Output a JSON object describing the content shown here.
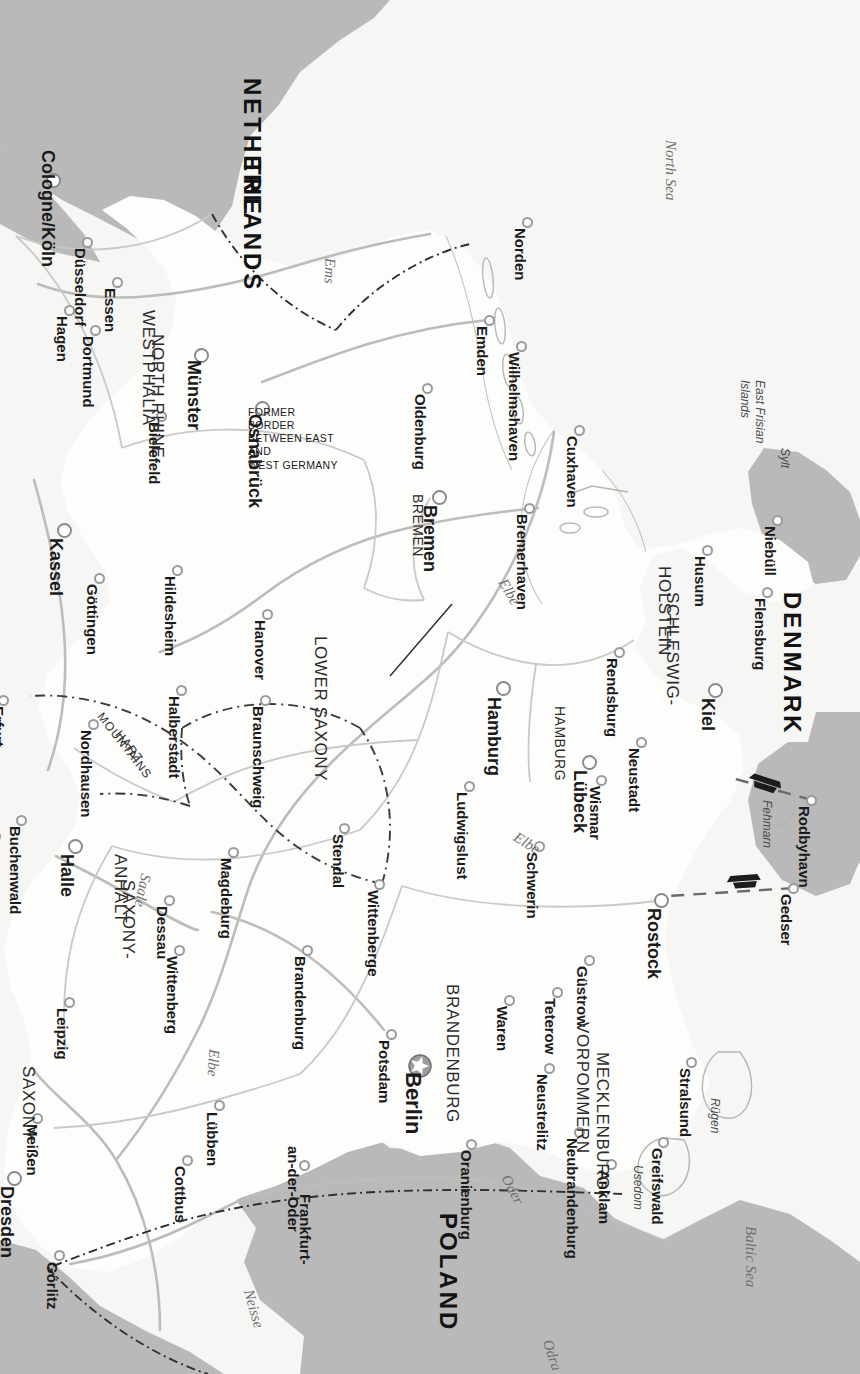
{
  "page": {
    "corner_marker": "16",
    "title": "Germany"
  },
  "annotations": {
    "former_border": "FORMER BORDER BETWEEN EAST AND WEST GERMANY",
    "former_border_lines": [
      "FORMER BORDER",
      "BETWEEN EAST AND",
      "WEST GERMANY"
    ]
  },
  "colors": {
    "neighbour_fill": "#b9b9b9",
    "sea_fill": "#f4f4f2",
    "germany_fill": "#fdfdfc",
    "border_line": "#8f8f8f",
    "river_line": "#b4b4b4",
    "dashed_border": "#3a3a3a",
    "paper": "#f2f2f0"
  },
  "countries": [
    {
      "name": "POLAND",
      "x": 1213,
      "y": 412,
      "rot": 0
    },
    {
      "name": "DENMARK",
      "x": 592,
      "y": 68,
      "rot": 0
    },
    {
      "name": "THE",
      "x": 160,
      "y": 608,
      "rot": 0
    },
    {
      "name": "NETHERLANDS",
      "x": 78,
      "y": 608,
      "rot": 0
    }
  ],
  "seas": [
    {
      "name": "Baltic Sea",
      "x": 1226,
      "y": 110,
      "rot": 0
    },
    {
      "name": "North Sea",
      "x": 140,
      "y": 190,
      "rot": 0
    }
  ],
  "rivers": [
    {
      "name": "Odra",
      "x": 1340,
      "y": 313,
      "rot": -18
    },
    {
      "name": "Oder",
      "x": 1176,
      "y": 355,
      "rot": -28
    },
    {
      "name": "Neisse",
      "x": 1290,
      "y": 612,
      "rot": -16
    },
    {
      "name": "Elbe",
      "x": 1049,
      "y": 646,
      "rot": 4
    },
    {
      "name": "Elbe",
      "x": 836,
      "y": 345,
      "rot": -58
    },
    {
      "name": "Elbe",
      "x": 580,
      "y": 358,
      "rot": -30
    },
    {
      "name": "Saale",
      "x": 874,
      "y": 714,
      "rot": 12
    },
    {
      "name": "Ems",
      "x": 258,
      "y": 530,
      "rot": 2
    }
  ],
  "islands": [
    {
      "name": "Rügen",
      "x": 1098,
      "y": 145
    },
    {
      "name": "Usedom",
      "x": 1165,
      "y": 222
    },
    {
      "name": "Fehmarn",
      "x": 800,
      "y": 93
    },
    {
      "name": "Sylt",
      "x": 448,
      "y": 75
    },
    {
      "name": "East Frisian\nIslands",
      "x": 380,
      "y": 100
    }
  ],
  "states": [
    {
      "name": "MECKLENBURG-",
      "x": 1052,
      "y": 258,
      "cls": "state"
    },
    {
      "name": "VORPOMMERN",
      "x": 1022,
      "y": 278,
      "cls": "state"
    },
    {
      "name": "BRANDENBURG",
      "x": 984,
      "y": 408,
      "cls": "state"
    },
    {
      "name": "SAXONY",
      "x": 1066,
      "y": 832,
      "cls": "state"
    },
    {
      "name": "SAXONY-",
      "x": 880,
      "y": 732,
      "cls": "state"
    },
    {
      "name": "ANHALT",
      "x": 854,
      "y": 740,
      "cls": "state"
    },
    {
      "name": "LOWER SAXONY",
      "x": 636,
      "y": 540,
      "cls": "state"
    },
    {
      "name": "NORTH RHINE-",
      "x": 334,
      "y": 703,
      "cls": "state"
    },
    {
      "name": "WESTPHALIA",
      "x": 310,
      "y": 712,
      "cls": "state"
    },
    {
      "name": "SCHLESWIG-",
      "x": 592,
      "y": 188,
      "cls": "state"
    },
    {
      "name": "HOLSTEIN",
      "x": 566,
      "y": 196,
      "cls": "state"
    },
    {
      "name": "HAMBURG",
      "x": 706,
      "y": 300,
      "cls": "state-sm"
    },
    {
      "name": "BREMEN",
      "x": 494,
      "y": 442,
      "cls": "state-sm"
    }
  ],
  "mountains": [
    {
      "name": "HARZ",
      "x": 732,
      "y": 742
    },
    {
      "name": "MOUNTAINS",
      "x": 714,
      "y": 760
    }
  ],
  "cities": [
    {
      "name": "Berlin",
      "x": 1066,
      "y": 440,
      "dx": 1072,
      "dy": 447,
      "size": "lg",
      "capital": true
    },
    {
      "name": "Hamburg",
      "x": 688,
      "y": 356,
      "dx": 697,
      "dy": 366,
      "size": "md"
    },
    {
      "name": "Bremen",
      "x": 497,
      "y": 420,
      "dx": 505,
      "dy": 430,
      "size": "md"
    },
    {
      "name": "Lübeck",
      "x": 762,
      "y": 270,
      "dx": 770,
      "dy": 280,
      "size": "md"
    },
    {
      "name": "Kiel",
      "x": 690,
      "y": 144,
      "dx": 698,
      "dy": 152,
      "size": "md"
    },
    {
      "name": "Halle",
      "x": 846,
      "y": 784,
      "dx": 854,
      "dy": 793,
      "size": "md"
    },
    {
      "name": "Kassel",
      "x": 530,
      "y": 795,
      "dx": 538,
      "dy": 804,
      "size": "md"
    },
    {
      "name": "Dresden",
      "x": 1178,
      "y": 845,
      "dx": 1186,
      "dy": 853,
      "size": "md"
    },
    {
      "name": "Münster",
      "x": 355,
      "y": 658,
      "dx": 360,
      "dy": 666,
      "size": "md"
    },
    {
      "name": "Osnabrück",
      "x": 408,
      "y": 597,
      "dx": 414,
      "dy": 605,
      "size": "md"
    },
    {
      "name": "Cologne/Köln",
      "x": 180,
      "y": 806,
      "dx": 150,
      "dy": 812,
      "size": "md"
    },
    {
      "name": "Rostock",
      "x": 900,
      "y": 198,
      "dx": 908,
      "dy": 206,
      "size": "md"
    },
    {
      "name": "Potsdam",
      "x": 1034,
      "y": 468,
      "dx": 1040,
      "dy": 476,
      "size": "sm"
    },
    {
      "name": "Oranienburg",
      "x": 1144,
      "y": 388,
      "dx": 1150,
      "dy": 394,
      "size": "sm"
    },
    {
      "name": "Frankfurt-",
      "x": 1185,
      "y": 555,
      "dx": 0,
      "dy": 0,
      "size": "sm",
      "nodot": true
    },
    {
      "name": "an-der-Oder",
      "x": 1165,
      "y": 555,
      "dx": 1146,
      "dy": 567,
      "size": "sm"
    },
    {
      "name": "Lübben",
      "x": 1105,
      "y": 640,
      "dx": 1112,
      "dy": 648,
      "size": "sm"
    },
    {
      "name": "Cottbus",
      "x": 1160,
      "y": 672,
      "dx": 1166,
      "dy": 680,
      "size": "sm"
    },
    {
      "name": "Görlitz",
      "x": 1255,
      "y": 800,
      "dx": 1262,
      "dy": 808,
      "size": "sm"
    },
    {
      "name": "Meißen",
      "x": 1118,
      "y": 822,
      "dx": 1124,
      "dy": 828,
      "size": "sm"
    },
    {
      "name": "Leipzig",
      "x": 1002,
      "y": 790,
      "dx": 1008,
      "dy": 798,
      "size": "sm"
    },
    {
      "name": "Wittenberg",
      "x": 950,
      "y": 680,
      "dx": 956,
      "dy": 688,
      "size": "sm"
    },
    {
      "name": "Dessau",
      "x": 900,
      "y": 690,
      "dx": 906,
      "dy": 698,
      "size": "sm"
    },
    {
      "name": "Magdeburg",
      "x": 852,
      "y": 626,
      "dx": 858,
      "dy": 634,
      "size": "sm"
    },
    {
      "name": "Brandenburg",
      "x": 950,
      "y": 552,
      "dx": 956,
      "dy": 560,
      "size": "sm"
    },
    {
      "name": "Wittenberge",
      "x": 884,
      "y": 480,
      "dx": 890,
      "dy": 487,
      "size": "sm"
    },
    {
      "name": "Stendal",
      "x": 828,
      "y": 515,
      "dx": 834,
      "dy": 522,
      "size": "sm"
    },
    {
      "name": "Ludwigslust",
      "x": 786,
      "y": 390,
      "dx": 792,
      "dy": 398,
      "size": "sm"
    },
    {
      "name": "Schwerin",
      "x": 846,
      "y": 320,
      "dx": 852,
      "dy": 328,
      "size": "sm"
    },
    {
      "name": "Wismar",
      "x": 780,
      "y": 258,
      "dx": 786,
      "dy": 265,
      "size": "sm"
    },
    {
      "name": "Neustadt",
      "x": 742,
      "y": 218,
      "dx": 748,
      "dy": 226,
      "size": "sm"
    },
    {
      "name": "Güstrow",
      "x": 960,
      "y": 270,
      "dx": 966,
      "dy": 278,
      "size": "sm"
    },
    {
      "name": "Teterow",
      "x": 992,
      "y": 302,
      "dx": 998,
      "dy": 310,
      "size": "sm"
    },
    {
      "name": "Waren",
      "x": 1000,
      "y": 350,
      "dx": 1006,
      "dy": 358,
      "size": "sm"
    },
    {
      "name": "Neustrelitz",
      "x": 1068,
      "y": 310,
      "dx": 1074,
      "dy": 318,
      "size": "sm"
    },
    {
      "name": "Neubrandenburg",
      "x": 1132,
      "y": 280,
      "dx": 1138,
      "dy": 288,
      "size": "sm"
    },
    {
      "name": "Anklam",
      "x": 1164,
      "y": 248,
      "dx": 1170,
      "dy": 256,
      "size": "sm"
    },
    {
      "name": "Greifswald",
      "x": 1142,
      "y": 196,
      "dx": 1148,
      "dy": 203,
      "size": "sm"
    },
    {
      "name": "Stralsund",
      "x": 1062,
      "y": 168,
      "dx": 1068,
      "dy": 175,
      "size": "sm"
    },
    {
      "name": "Gedser",
      "x": 888,
      "y": 66,
      "dx": 894,
      "dy": 74,
      "size": "sm"
    },
    {
      "name": "Rodbyhavn",
      "x": 800,
      "y": 48,
      "dx": 806,
      "dy": 56,
      "size": "sm"
    },
    {
      "name": "Flensburg",
      "x": 592,
      "y": 92,
      "dx": 598,
      "dy": 100,
      "size": "sm"
    },
    {
      "name": "Niebüll",
      "x": 520,
      "y": 82,
      "dx": 526,
      "dy": 90,
      "size": "sm"
    },
    {
      "name": "Husum",
      "x": 550,
      "y": 152,
      "dx": 556,
      "dy": 160,
      "size": "sm"
    },
    {
      "name": "Rendsburg",
      "x": 652,
      "y": 240,
      "dx": 658,
      "dy": 248,
      "size": "sm"
    },
    {
      "name": "Cuxhaven",
      "x": 430,
      "y": 280,
      "dx": 436,
      "dy": 288,
      "size": "sm"
    },
    {
      "name": "Bremerhaven",
      "x": 508,
      "y": 330,
      "dx": 514,
      "dy": 338,
      "size": "sm"
    },
    {
      "name": "Wilhelmshaven",
      "x": 346,
      "y": 338,
      "dx": 352,
      "dy": 346,
      "size": "sm"
    },
    {
      "name": "Emden",
      "x": 320,
      "y": 370,
      "dx": 326,
      "dy": 378,
      "size": "sm"
    },
    {
      "name": "Norden",
      "x": 222,
      "y": 332,
      "dx": 228,
      "dy": 340,
      "size": "sm"
    },
    {
      "name": "Oldenburg",
      "x": 388,
      "y": 432,
      "dx": 394,
      "dy": 440,
      "size": "sm"
    },
    {
      "name": "Bielefeld",
      "x": 416,
      "y": 698,
      "dx": 422,
      "dy": 706,
      "size": "sm"
    },
    {
      "name": "Hanover",
      "x": 614,
      "y": 592,
      "dx": 620,
      "dy": 600,
      "size": "sm"
    },
    {
      "name": "Hildesheim",
      "x": 570,
      "y": 682,
      "dx": 576,
      "dy": 690,
      "size": "sm"
    },
    {
      "name": "Braunschweig",
      "x": 700,
      "y": 594,
      "dx": 706,
      "dy": 602,
      "size": "sm"
    },
    {
      "name": "Halberstadt",
      "x": 690,
      "y": 678,
      "dx": 696,
      "dy": 686,
      "size": "sm"
    },
    {
      "name": "Göttingen",
      "x": 578,
      "y": 760,
      "dx": 584,
      "dy": 768,
      "size": "sm"
    },
    {
      "name": "Nordhausen",
      "x": 724,
      "y": 766,
      "dx": 730,
      "dy": 774,
      "size": "sm"
    },
    {
      "name": "Buchenwald",
      "x": 820,
      "y": 838,
      "dx": 826,
      "dy": 845,
      "size": "sm"
    },
    {
      "name": "Weimar",
      "x": 836,
      "y": 864,
      "dx": 842,
      "dy": 870,
      "size": "sm"
    },
    {
      "name": "Erfurt",
      "x": 700,
      "y": 856,
      "dx": 706,
      "dy": 862,
      "size": "sm"
    },
    {
      "name": "Dortmund",
      "x": 330,
      "y": 764,
      "dx": 336,
      "dy": 772,
      "size": "sm"
    },
    {
      "name": "Hagen",
      "x": 310,
      "y": 790,
      "dx": 316,
      "dy": 798,
      "size": "sm"
    },
    {
      "name": "Essen",
      "x": 282,
      "y": 742,
      "dx": 288,
      "dy": 750,
      "size": "sm"
    },
    {
      "name": "Düsseldorf",
      "x": 242,
      "y": 772,
      "dx": 248,
      "dy": 780,
      "size": "sm"
    }
  ]
}
